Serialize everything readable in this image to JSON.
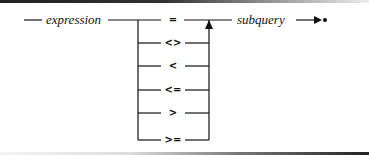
{
  "diagram": {
    "type": "syntax-railroad",
    "start_term": "expression",
    "end_term": "subquery",
    "operators": [
      "=",
      "<>",
      "<",
      "<=",
      ">",
      ">="
    ],
    "end_marker": "arrow-to-terminator"
  }
}
